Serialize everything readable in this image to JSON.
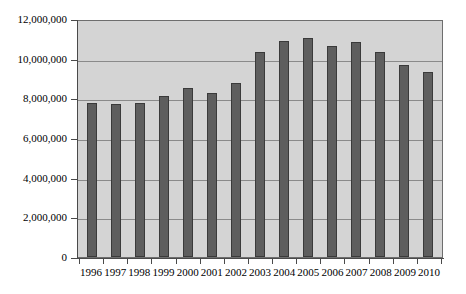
{
  "chart_data": {
    "type": "bar",
    "title": "",
    "subtitle": "",
    "xlabel": "",
    "ylabel": "",
    "categories": [
      "1996",
      "1997",
      "1998",
      "1999",
      "2000",
      "2001",
      "2002",
      "2003",
      "2004",
      "2005",
      "2006",
      "2007",
      "2008",
      "2009",
      "2010"
    ],
    "values": [
      7750000,
      7700000,
      7750000,
      8100000,
      8500000,
      8250000,
      8750000,
      10350000,
      10900000,
      11050000,
      10650000,
      10850000,
      10350000,
      9700000,
      9350000
    ],
    "series": [
      {
        "name": "",
        "values": [
          7750000,
          7700000,
          7750000,
          8100000,
          8500000,
          8250000,
          8750000,
          10350000,
          10900000,
          11050000,
          10650000,
          10850000,
          10350000,
          9700000,
          9350000
        ]
      }
    ],
    "ylim": [
      0,
      12000000
    ],
    "ytick_values": [
      0,
      2000000,
      4000000,
      6000000,
      8000000,
      10000000,
      12000000
    ],
    "ytick_labels": [
      "0",
      "2,000,000",
      "4,000,000",
      "6,000,000",
      "8,000,000",
      "10,000,000",
      "12,000,000"
    ],
    "grid": true,
    "grid_axis": "y",
    "legend": false,
    "legend_position": "none",
    "colors": {
      "bar_fill": "#5e5e5e",
      "bar_border": "#3a3a3a",
      "plot_background": "#d4d4d4",
      "plot_border": "#6e6e6e",
      "gridline": "#8a8a8a",
      "axis": "#4a4a4a",
      "text": "#000000",
      "page_background": "#ffffff"
    }
  }
}
